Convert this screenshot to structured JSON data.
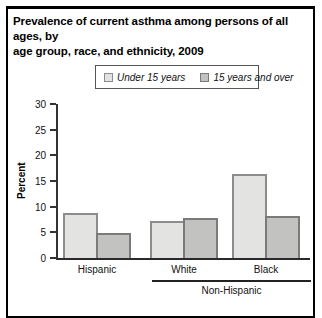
{
  "figure": {
    "title_lines": [
      "Prevalence of current asthma among persons of all ages, by",
      "age group, race, and ethnicity, 2009"
    ]
  },
  "legend": {
    "items": [
      {
        "label": "Under 15 years",
        "color": "#e3e3e1",
        "border": "#8c8c8c"
      },
      {
        "label": "15 years and over",
        "color": "#c2c2c0",
        "border": "#7a7a7a"
      }
    ]
  },
  "chart_data": {
    "type": "bar",
    "title": "Prevalence of current asthma among persons of all ages, by age group, race, and ethnicity, 2009",
    "xlabel": "",
    "ylabel": "Percent",
    "ylim": [
      0,
      30
    ],
    "yticks": [
      0,
      5,
      10,
      15,
      20,
      25,
      30
    ],
    "categories": [
      "Hispanic",
      "White",
      "Black"
    ],
    "series": [
      {
        "name": "Under 15 years",
        "values": [
          8.8,
          7.3,
          16.4
        ]
      },
      {
        "name": "15 years and over",
        "values": [
          4.9,
          7.8,
          8.1
        ]
      }
    ],
    "group_note": {
      "label": "Non-Hispanic",
      "applies_to": [
        "White",
        "Black"
      ]
    },
    "legend_position": "top",
    "grid": false
  }
}
